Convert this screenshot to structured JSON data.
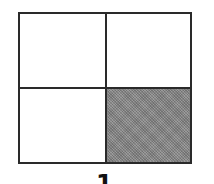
{
  "diagram": {
    "type": "grid",
    "rows": 2,
    "cols": 2,
    "shaded_cells": [
      {
        "row": 2,
        "col": 2
      }
    ],
    "shade_color": "#8a8a8a",
    "line_color": "#2a2a2a",
    "label": "1"
  }
}
